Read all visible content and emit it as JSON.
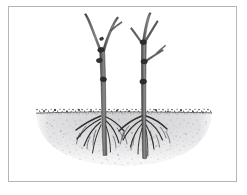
{
  "figure": {
    "title": "Two bare-root trees planted in a broad saucer-shaped planting hole",
    "caption": "",
    "background_color": "#ffffff",
    "frame": {
      "border_color": "#b5b5b7",
      "border_width": "1px",
      "x": 8,
      "y": 6,
      "width": 229,
      "height": 176
    },
    "style": "line-drawing",
    "medium": "ink-and-wash"
  },
  "palette": {
    "ink_dark": "#2f2e2e",
    "ink_mid": "#555253",
    "ink_light": "#7d7a7b",
    "bark_fill": "#6d6a6a",
    "bark_shadow": "#3a3838",
    "bark_highlight": "#9a9697",
    "soil_surface": "#3b3939",
    "hole_fill_top": "#d8d8da",
    "hole_fill_bottom": "#ececee",
    "speckle": "#6e6c6d",
    "paper": "#ffffff"
  },
  "scene": {
    "ground_line_y": 113,
    "ground_left_x": 36,
    "ground_right_x": 212,
    "hole_depth_y": 166,
    "hole_shape": "saucer",
    "surface_texture": "stipple",
    "subjects_count": 2
  },
  "trees": [
    {
      "id": "tree-left",
      "label": "Left bare-root tree",
      "trunk_base_x": 104,
      "trunk_top_y": 14,
      "ground_y": 113,
      "root_depth_y": 158,
      "branch_count": 2,
      "pruning_knob_count": 4,
      "root_count": 7,
      "description": "Slender leaning whip with a narrow V fork near the top and four dark pruning knobs along the trunk"
    },
    {
      "id": "tree-right",
      "label": "Right bare-root tree",
      "trunk_base_x": 144,
      "trunk_top_y": 13,
      "ground_y": 113,
      "root_depth_y": 160,
      "branch_count": 3,
      "pruning_knob_count": 3,
      "root_count": 8,
      "description": "Upright whip with a leading shoot, two side laterals and three dark pruning knobs along the trunk"
    }
  ],
  "annotations": []
}
